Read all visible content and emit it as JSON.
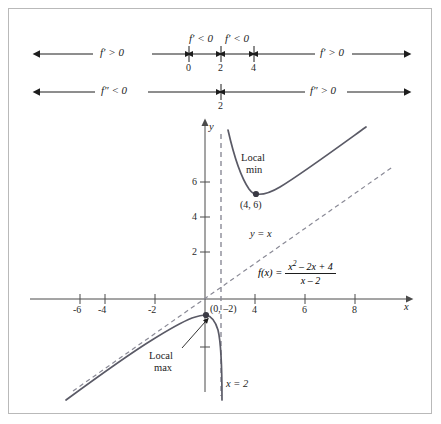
{
  "sign_lines": [
    {
      "id": "first-derivative",
      "symbol": "f'",
      "ticks": [
        "0",
        "2",
        "4"
      ],
      "segments": [
        {
          "label": "f′ > 0"
        },
        {
          "label": "f′ < 0"
        },
        {
          "label": "f′ < 0"
        },
        {
          "label": "f′ > 0"
        }
      ]
    },
    {
      "id": "second-derivative",
      "symbol": "f''",
      "ticks": [
        "2"
      ],
      "segments": [
        {
          "label": "f″ < 0"
        },
        {
          "label": "f″ > 0"
        }
      ]
    }
  ],
  "graph": {
    "axis_x_label": "x",
    "axis_y_label": "y",
    "x_ticks": [
      "-6",
      "-4",
      "-2",
      "4",
      "6",
      "8"
    ],
    "y_ticks": [
      "2",
      "4",
      "6"
    ],
    "slant_asymptote_label": "y = x",
    "vertical_asymptote_label": "x = 2",
    "annotations": [
      {
        "id": "local-min",
        "line1": "Local",
        "line2": "min",
        "point_label": "(4, 6)"
      },
      {
        "id": "local-max",
        "line1": "Local",
        "line2": "max",
        "point_label": "(0, –2)"
      }
    ],
    "function": {
      "lhs": "f(x) =",
      "numerator": "x² – 2x + 4",
      "denominator": "x – 2"
    }
  },
  "chart_data": {
    "type": "line",
    "xlabel": "x",
    "ylabel": "y",
    "xlim": [
      -7,
      9.5
    ],
    "ylim": [
      -8,
      9
    ],
    "grid": false,
    "legend": "none",
    "x_ticks": [
      -6,
      -4,
      -2,
      4,
      6,
      8
    ],
    "y_ticks": [
      2,
      4,
      6
    ],
    "series": [
      {
        "name": "f(x) = (x^2 - 2x + 4)/(x - 2)",
        "style": "solid",
        "color": "#5a5a66",
        "branches": [
          {
            "name": "left-branch",
            "points": [
              [
                -6.6,
                -7.0
              ],
              [
                -6.0,
                -6.5
              ],
              [
                -5.0,
                -5.57
              ],
              [
                -4.0,
                -4.67
              ],
              [
                -3.0,
                -3.8
              ],
              [
                -2.0,
                -3.0
              ],
              [
                -1.0,
                -2.33
              ],
              [
                -0.5,
                -2.1
              ],
              [
                0.0,
                -2.0
              ],
              [
                0.5,
                -2.17
              ],
              [
                1.0,
                -3.0
              ],
              [
                1.4,
                -4.6
              ],
              [
                1.7,
                -8.0
              ]
            ]
          },
          {
            "name": "right-branch",
            "points": [
              [
                2.35,
                9.0
              ],
              [
                2.5,
                7.5
              ],
              [
                3.0,
                7.0
              ],
              [
                3.5,
                6.17
              ],
              [
                4.0,
                6.0
              ],
              [
                4.5,
                6.1
              ],
              [
                5.0,
                6.33
              ],
              [
                6.0,
                7.0
              ],
              [
                7.0,
                7.8
              ],
              [
                8.0,
                8.67
              ],
              [
                8.6,
                9.0
              ]
            ]
          }
        ]
      },
      {
        "name": "y = x (slant asymptote)",
        "style": "dashed",
        "color": "#8a8a96",
        "points": [
          [
            -6.9,
            -6.9
          ],
          [
            9.2,
            9.2
          ]
        ]
      },
      {
        "name": "x = 2 (vertical asymptote)",
        "style": "dashed",
        "color": "#8a8a96",
        "points": [
          [
            2,
            -8.5
          ],
          [
            2,
            9.2
          ]
        ]
      }
    ],
    "marked_points": [
      {
        "label": "(4, 6)",
        "x": 4,
        "y": 6,
        "note": "Local min"
      },
      {
        "label": "(0, –2)",
        "x": 0,
        "y": -2,
        "note": "Local max"
      }
    ]
  }
}
